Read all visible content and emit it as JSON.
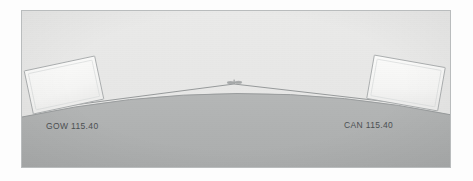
{
  "figure": {
    "frame": {
      "border_color": "#b9bcbd",
      "x": 21,
      "y": 10,
      "width": 430,
      "height": 158
    },
    "colors": {
      "sky": "#e8e8e7",
      "earth": "#b0b2b2",
      "earth_edge": "#9a9d9e",
      "panel_fill": "#f7f7f6",
      "panel_edge": "#a9acad",
      "line": "#8c9091",
      "text": "#4c5052",
      "page": "#fdfdfd"
    }
  },
  "earth": {
    "name": "earth-curvature",
    "apex_y": 80,
    "left_edge_y": 106,
    "right_edge_y": 104,
    "fill": "#b0b2b2"
  },
  "stations": [
    {
      "id": "station-left",
      "label": "GOW 115.40",
      "ident": "GOW",
      "frequency": "115.40",
      "panel": {
        "x": 6,
        "y": 52,
        "width": 72,
        "height": 44,
        "rotation_deg": -12
      }
    },
    {
      "id": "station-right",
      "label": "CAN 115.40",
      "ident": "CAN",
      "frequency": "115.40",
      "panel": {
        "x": 348,
        "y": 50,
        "width": 72,
        "height": 44,
        "rotation_deg": 10
      }
    }
  ],
  "aircraft": {
    "name": "aircraft-symbol",
    "x": 212,
    "y": 72,
    "label": ""
  },
  "signal_paths": [
    {
      "id": "path-left",
      "from": "station-left",
      "to": "aircraft",
      "style": "straight-line"
    },
    {
      "id": "path-right",
      "from": "station-right",
      "to": "aircraft",
      "style": "straight-line"
    }
  ]
}
